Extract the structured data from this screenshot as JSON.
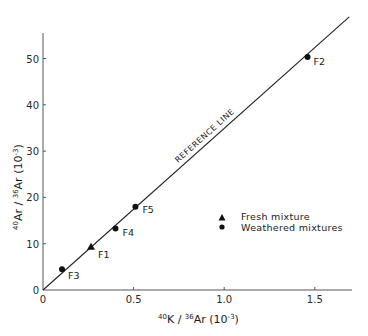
{
  "chart_data": {
    "type": "scatter",
    "title": "",
    "xlabel": "40K / 36Ar (10-3)",
    "ylabel": "40Ar / 36Ar (10-3)",
    "xlabel_parts": {
      "sup1": "40",
      "main1": "K / ",
      "sup2": "36",
      "main2": "Ar (10",
      "sup3": "-3",
      "main3": ")"
    },
    "ylabel_parts": {
      "sup1": "40",
      "main1": "Ar / ",
      "sup2": "36",
      "main2": "Ar (10",
      "sup3": "-3",
      "main3": ")"
    },
    "xlim": [
      0,
      1.7
    ],
    "ylim": [
      0,
      55
    ],
    "grid": false,
    "x_ticks": [
      {
        "value": 0,
        "label": "0"
      },
      {
        "value": 0.5,
        "label": "0.5"
      },
      {
        "value": 1.0,
        "label": "1.0"
      },
      {
        "value": 1.5,
        "label": "1.5"
      }
    ],
    "y_ticks": [
      {
        "value": 0,
        "label": "0"
      },
      {
        "value": 10,
        "label": "10"
      },
      {
        "value": 20,
        "label": "20"
      },
      {
        "value": 30,
        "label": "30"
      },
      {
        "value": 40,
        "label": "40"
      },
      {
        "value": 50,
        "label": "50"
      }
    ],
    "reference_line": {
      "label": "REFERENCE LINE",
      "from": [
        0,
        0
      ],
      "to": [
        1.69,
        59.0
      ]
    },
    "series": [
      {
        "name": "Fresh mixture",
        "marker": "triangle",
        "points": [
          {
            "label": "F1",
            "x": 0.265,
            "y": 9.3
          }
        ]
      },
      {
        "name": "Weathered mixtures",
        "marker": "circle",
        "points": [
          {
            "label": "F2",
            "x": 1.46,
            "y": 50.3
          },
          {
            "label": "F3",
            "x": 0.105,
            "y": 4.5
          },
          {
            "label": "F4",
            "x": 0.4,
            "y": 13.3
          },
          {
            "label": "F5",
            "x": 0.51,
            "y": 18.0
          }
        ]
      }
    ],
    "legend": {
      "position": "right-middle",
      "entries": [
        {
          "marker": "triangle",
          "label": "Fresh mixture"
        },
        {
          "marker": "circle",
          "label": "Weathered mixtures"
        }
      ]
    }
  }
}
